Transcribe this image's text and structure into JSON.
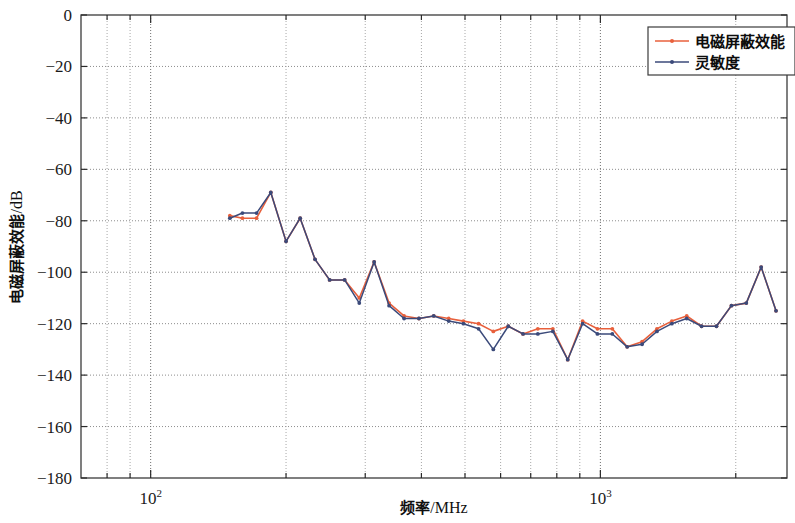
{
  "chart_data": {
    "type": "line",
    "title": "",
    "xlabel": "频率/MHz",
    "ylabel": "电磁屏蔽效能/dB",
    "xscale": "log",
    "yscale": "linear",
    "xlim": [
      70,
      2600
    ],
    "ylim": [
      -180,
      0
    ],
    "grid": true,
    "yticks": [
      0,
      -20,
      -40,
      -60,
      -80,
      -100,
      -120,
      -140,
      -160,
      -180
    ],
    "ytick_labels": [
      "0",
      "-20",
      "-40",
      "-60",
      "-80",
      "-100",
      "-120",
      "-140",
      "-160",
      "-180"
    ],
    "xticks_major": [
      100,
      1000
    ],
    "xtick_major_labels": [
      "10²",
      "10³"
    ],
    "xticks_minor": [
      80,
      90,
      200,
      300,
      400,
      500,
      600,
      700,
      800,
      900,
      2000
    ],
    "legend_position": "top-right",
    "series": [
      {
        "name": "电磁屏蔽效能",
        "color": "#E8603C",
        "marker": "dot",
        "x": [
          150,
          160,
          172,
          185,
          200,
          215,
          232,
          250,
          270,
          291,
          314,
          339,
          366,
          395,
          426,
          460,
          496,
          536,
          578,
          624,
          673,
          726,
          784,
          846,
          913,
          985,
          1063,
          1147,
          1238,
          1336,
          1442,
          1556,
          1679,
          1812,
          1956,
          2111,
          2278,
          2458
        ],
        "y": [
          -78,
          -79,
          -79,
          -69,
          -88,
          -79,
          -95,
          -103,
          -103,
          -110,
          -96,
          -112,
          -117,
          -118,
          -117,
          -118,
          -119,
          -120,
          -123,
          -121,
          -124,
          -122,
          -122,
          -134,
          -119,
          -122,
          -122,
          -129,
          -127,
          -122,
          -119,
          -117,
          -121,
          -121,
          -113,
          -112,
          -98,
          -115
        ]
      },
      {
        "name": "灵敏度",
        "color": "#3B4A7A",
        "marker": "dot",
        "x": [
          150,
          160,
          172,
          185,
          200,
          215,
          232,
          250,
          270,
          291,
          314,
          339,
          366,
          395,
          426,
          460,
          496,
          536,
          578,
          624,
          673,
          726,
          784,
          846,
          913,
          985,
          1063,
          1147,
          1238,
          1336,
          1442,
          1556,
          1679,
          1812,
          1956,
          2111,
          2278,
          2458
        ],
        "y": [
          -79,
          -77,
          -77,
          -69,
          -88,
          -79,
          -95,
          -103,
          -103,
          -112,
          -96,
          -113,
          -118,
          -118,
          -117,
          -119,
          -120,
          -122,
          -130,
          -121,
          -124,
          -124,
          -123,
          -134,
          -120,
          -124,
          -124,
          -129,
          -128,
          -123,
          -120,
          -118,
          -121,
          -121,
          -113,
          -112,
          -98,
          -115
        ]
      }
    ]
  },
  "legend": {
    "items": [
      {
        "label": "电磁屏蔽效能",
        "color": "#E8603C"
      },
      {
        "label": "灵敏度",
        "color": "#3B4A7A"
      }
    ]
  },
  "axes": {
    "y_title_main": "电磁屏蔽效能",
    "y_title_unit": "/dB",
    "x_title_main": "频率",
    "x_title_unit": "/MHz"
  }
}
